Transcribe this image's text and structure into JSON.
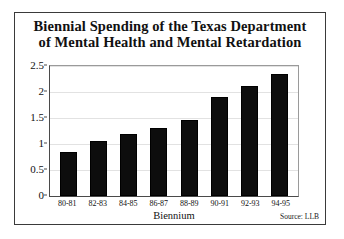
{
  "figure": {
    "title_lines": [
      "Biennial Spending of the Texas Department",
      "of Mental Health and Mental Retardation"
    ],
    "unit_label": "Millions of Dollars",
    "source_note": "Source: LLB"
  },
  "chart_data": {
    "type": "bar",
    "title": "Biennial Spending of the Texas Department of Mental Health and Mental Retardation",
    "xlabel": "Biennium",
    "ylabel": "Millions of Dollars",
    "categories": [
      "80-81",
      "82-83",
      "84-85",
      "86-87",
      "88-89",
      "90-91",
      "92-93",
      "94-95"
    ],
    "values": [
      0.85,
      1.05,
      1.2,
      1.3,
      1.47,
      1.9,
      2.12,
      2.35
    ],
    "ylim": [
      0,
      2.5
    ],
    "yticks": [
      0,
      0.5,
      1,
      1.5,
      2,
      2.5
    ],
    "ytick_labels": [
      "0",
      "0.5",
      "1",
      "1.5",
      "2",
      "2.5"
    ],
    "grid": true,
    "legend": "none",
    "bar_color": "#0d0d0d",
    "annotations": [
      "Source: LLB"
    ]
  }
}
